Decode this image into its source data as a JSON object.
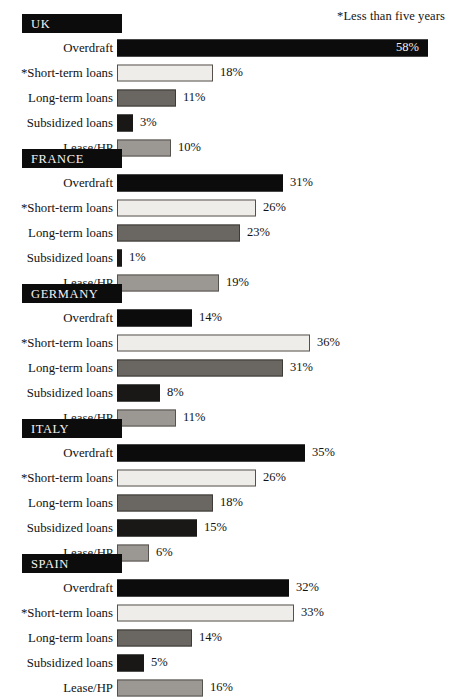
{
  "footnote": "*Less than five years",
  "chart_data": {
    "type": "bar",
    "title": "",
    "subtitle": "",
    "xlabel": "",
    "ylabel": "",
    "xlim": [
      0,
      60
    ],
    "grid": false,
    "legend_position": "none",
    "orientation": "horizontal",
    "value_suffix": "%",
    "annotations": [
      "*Less than five years"
    ],
    "categories": [
      "Overdraft",
      "*Short-term loans",
      "Long-term loans",
      "Subsidized loans",
      "Lease/HP"
    ],
    "groups": [
      {
        "name": "UK",
        "values": [
          58,
          18,
          11,
          3,
          10
        ],
        "labels": [
          "58%",
          "18%",
          "11%",
          "3%",
          "10%"
        ]
      },
      {
        "name": "FRANCE",
        "values": [
          31,
          26,
          23,
          1,
          19
        ],
        "labels": [
          "31%",
          "26%",
          "23%",
          "1%",
          "19%"
        ]
      },
      {
        "name": "GERMANY",
        "values": [
          14,
          36,
          31,
          8,
          11
        ],
        "labels": [
          "14%",
          "36%",
          "31%",
          "8%",
          "11%"
        ]
      },
      {
        "name": "ITALY",
        "values": [
          35,
          26,
          18,
          15,
          6
        ],
        "labels": [
          "35%",
          "26%",
          "18%",
          "15%",
          "6%"
        ]
      },
      {
        "name": "SPAIN",
        "values": [
          32,
          33,
          14,
          5,
          16
        ],
        "labels": [
          "32%",
          "33%",
          "14%",
          "5%",
          "16%"
        ]
      }
    ],
    "series_styles": [
      {
        "name": "Overdraft",
        "fill": "#0d0c0c",
        "stroke": "#0d0c0c"
      },
      {
        "name": "*Short-term loans",
        "fill": "#efedea",
        "stroke": "#55504c"
      },
      {
        "name": "Long-term loans",
        "fill": "#6a6763",
        "stroke": "#3d3a37"
      },
      {
        "name": "Subsidized loans",
        "fill": "#191817",
        "stroke": "#191817"
      },
      {
        "name": "Lease/HP",
        "fill": "#9b9894",
        "stroke": "#56524e"
      }
    ]
  }
}
